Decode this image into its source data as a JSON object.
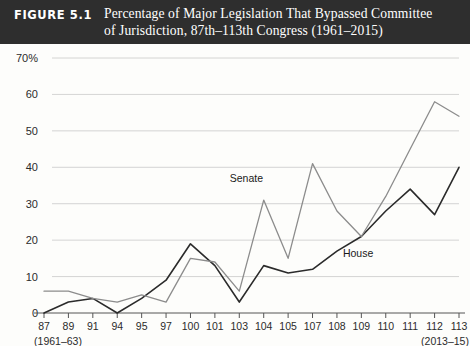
{
  "header": {
    "figure_label": "FIGURE 5.1",
    "title_line1": "Percentage of Major Legislation That Bypassed Committee",
    "title_line2": "of Jurisdiction, 87th–113th Congress (1961–2015)",
    "bar_color": "#2e2e2e",
    "text_color": "#ffffff"
  },
  "chart_data": {
    "type": "line",
    "title": "Percentage of Major Legislation That Bypassed Committee of Jurisdiction, 87th–113th Congress (1961–2015)",
    "xlabel": "",
    "ylabel": "",
    "categories": [
      "87",
      "89",
      "91",
      "94",
      "95",
      "97",
      "100",
      "101",
      "103",
      "104",
      "105",
      "107",
      "108",
      "109",
      "110",
      "111",
      "112",
      "113"
    ],
    "x_range_start_label": "(1961–63)",
    "x_range_end_label": "(2013–15)",
    "ylim": [
      0,
      70
    ],
    "yticks": [
      0,
      10,
      20,
      30,
      40,
      50,
      60,
      70
    ],
    "ytick_labels": [
      "0",
      "10",
      "20",
      "30",
      "40",
      "50",
      "60",
      "70%"
    ],
    "grid": true,
    "legend_position": "inline-annotations",
    "series": [
      {
        "name": "House",
        "color": "#2b2b2b",
        "label_x_index": 12,
        "values": [
          0,
          3,
          4,
          0,
          4,
          9,
          19,
          13,
          3,
          13,
          11,
          12,
          17,
          21,
          28,
          34,
          27,
          40
        ]
      },
      {
        "name": "Senate",
        "color": "#8c8c8c",
        "label_x_index": 9,
        "values": [
          6,
          6,
          4,
          3,
          5,
          3,
          15,
          14,
          6,
          31,
          15,
          41,
          28,
          21,
          32,
          45,
          58,
          54
        ]
      }
    ]
  }
}
